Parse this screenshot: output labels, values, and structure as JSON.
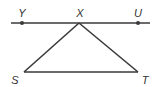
{
  "diagram": {
    "type": "geometry",
    "line_color": "#3a3a3a",
    "points": [
      {
        "name": "Y",
        "label": "Y",
        "x": 22,
        "y": 23,
        "lx": 22,
        "ly": 13
      },
      {
        "name": "X",
        "label": "X",
        "x": 79,
        "y": 23,
        "lx": 80,
        "ly": 13
      },
      {
        "name": "U",
        "label": "U",
        "x": 138,
        "y": 23,
        "lx": 138,
        "ly": 13
      },
      {
        "name": "S",
        "label": "S",
        "x": 24,
        "y": 72,
        "lx": 15,
        "ly": 80
      },
      {
        "name": "T",
        "label": "T",
        "x": 138,
        "y": 72,
        "lx": 145,
        "ly": 80
      }
    ],
    "segments": [
      {
        "from": "line-start",
        "to": "line-end",
        "note": "line through Y, X, U"
      },
      {
        "from": "X",
        "to": "S"
      },
      {
        "from": "X",
        "to": "T"
      },
      {
        "from": "S",
        "to": "T"
      }
    ]
  }
}
